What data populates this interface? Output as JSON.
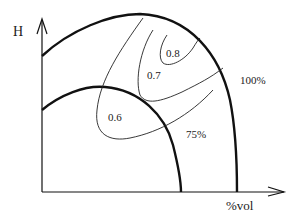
{
  "axes": {
    "y_label": "H",
    "x_label": "%vol"
  },
  "curves": {
    "outer_label": "100%",
    "inner_label": "75%"
  },
  "contours": [
    {
      "label": "0.6"
    },
    {
      "label": "0.7"
    },
    {
      "label": "0.8"
    }
  ],
  "colors": {
    "line": "#111111",
    "background": "#ffffff"
  }
}
